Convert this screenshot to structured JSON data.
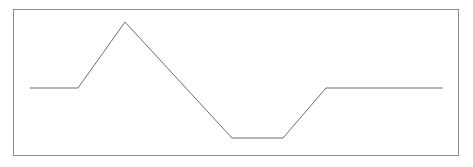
{
  "figure": {
    "title": "",
    "background_color": "#ffffff",
    "width": 473,
    "height": 167
  },
  "frame": {
    "name": "plot-border",
    "x": 13,
    "y": 9,
    "width": 445,
    "height": 146,
    "stroke_color": "#8c8c8c",
    "stroke_width": 1
  },
  "chart_data": {
    "type": "line",
    "title": "",
    "xlabel": "",
    "ylabel": "",
    "grid": false,
    "legend": null,
    "xlim": [
      13,
      458
    ],
    "ylim": [
      9,
      155
    ],
    "series": [
      {
        "name": "waveform",
        "color": "#6e6e6e",
        "stroke_width": 1,
        "x": [
          30,
          78,
          125,
          232,
          283,
          326,
          443
        ],
        "y": [
          88,
          88,
          22,
          138,
          138,
          88,
          88
        ],
        "segments": [
          {
            "label": "initial-plateau",
            "from": [
              30,
              88
            ],
            "to": [
              78,
              88
            ],
            "slope": "flat"
          },
          {
            "label": "rising-ramp",
            "from": [
              78,
              88
            ],
            "to": [
              125,
              22
            ],
            "slope": "up"
          },
          {
            "label": "falling-ramp",
            "from": [
              125,
              22
            ],
            "to": [
              232,
              138
            ],
            "slope": "down"
          },
          {
            "label": "trough-plateau",
            "from": [
              232,
              138
            ],
            "to": [
              283,
              138
            ],
            "slope": "flat"
          },
          {
            "label": "recovery-ramp",
            "from": [
              283,
              138
            ],
            "to": [
              326,
              88
            ],
            "slope": "up"
          },
          {
            "label": "final-plateau",
            "from": [
              326,
              88
            ],
            "to": [
              443,
              88
            ],
            "slope": "flat"
          }
        ]
      }
    ],
    "path_d": "M 30 88 L 78 88 L 125 22 L 232 138 L 283 138 L 326 88 L 443 88"
  }
}
